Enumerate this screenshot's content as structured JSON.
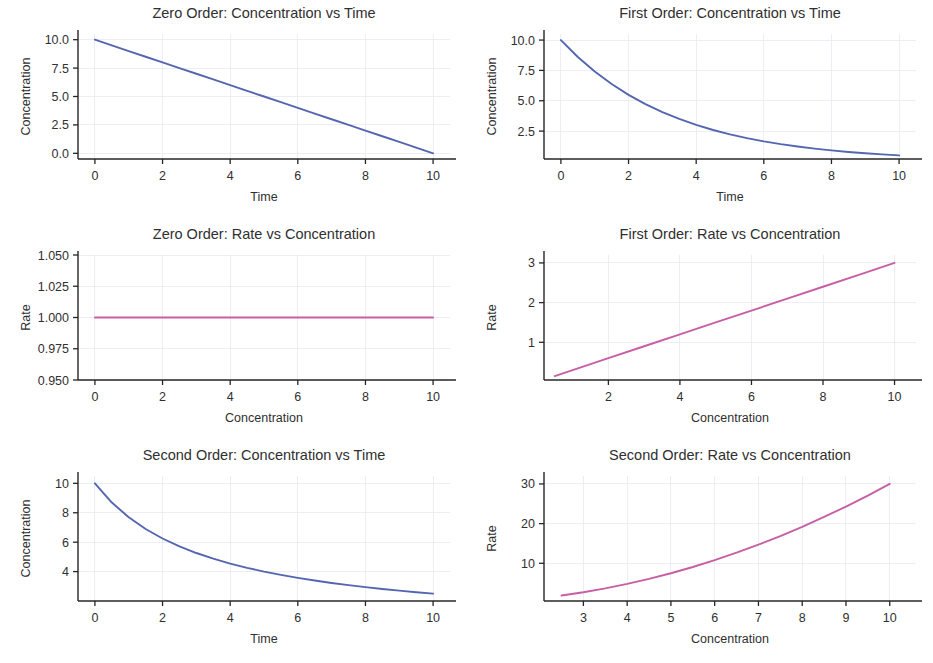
{
  "figure": {
    "background": "#ffffff",
    "rows": 3,
    "cols": 2,
    "width": 933,
    "height": 663
  },
  "colors": {
    "concentration_line": "#5566b0",
    "rate_line": "#c75fa5",
    "axis": "#262626",
    "grid": "#e9e9f2",
    "text": "#2f2f2f"
  },
  "chart_data": [
    {
      "id": "zero-order-conc-vs-time",
      "type": "line",
      "title": "Zero Order: Concentration vs Time",
      "xlabel": "Time",
      "ylabel": "Concentration",
      "color": "#5566b0",
      "xlim": [
        -0.5,
        10.5
      ],
      "ylim": [
        -0.5,
        10.5
      ],
      "xticks": [
        0,
        2,
        4,
        6,
        8,
        10
      ],
      "xticklabels": [
        "0",
        "2",
        "4",
        "6",
        "8",
        "10"
      ],
      "yticks": [
        0.0,
        2.5,
        5.0,
        7.5,
        10.0
      ],
      "yticklabels": [
        "0.0",
        "2.5",
        "5.0",
        "7.5",
        "10.0"
      ],
      "grid": true,
      "equation": "C = 10 - 1.0 t",
      "x": [
        0,
        0.5,
        1,
        1.5,
        2,
        2.5,
        3,
        3.5,
        4,
        4.5,
        5,
        5.5,
        6,
        6.5,
        7,
        7.5,
        8,
        8.5,
        9,
        9.5,
        10
      ],
      "y": [
        10.0,
        9.5,
        9.0,
        8.5,
        8.0,
        7.5,
        7.0,
        6.5,
        6.0,
        5.5,
        5.0,
        4.5,
        4.0,
        3.5,
        3.0,
        2.5,
        2.0,
        1.5,
        1.0,
        0.5,
        0.0
      ]
    },
    {
      "id": "first-order-conc-vs-time",
      "type": "line",
      "title": "First Order: Concentration vs Time",
      "xlabel": "Time",
      "ylabel": "Concentration",
      "color": "#5566b0",
      "xlim": [
        -0.5,
        10.5
      ],
      "ylim": [
        0.2,
        10.5
      ],
      "xticks": [
        0,
        2,
        4,
        6,
        8,
        10
      ],
      "xticklabels": [
        "0",
        "2",
        "4",
        "6",
        "8",
        "10"
      ],
      "yticks": [
        2.5,
        5.0,
        7.5,
        10.0
      ],
      "yticklabels": [
        "2.5",
        "5.0",
        "7.5",
        "10.0"
      ],
      "grid": true,
      "equation": "C = 10 e^(-0.3 t)",
      "x": [
        0,
        0.5,
        1,
        1.5,
        2,
        2.5,
        3,
        3.5,
        4,
        4.5,
        5,
        5.5,
        6,
        6.5,
        7,
        7.5,
        8,
        8.5,
        9,
        9.5,
        10
      ],
      "y": [
        10.0,
        8.607,
        7.408,
        6.376,
        5.488,
        4.724,
        4.066,
        3.499,
        3.012,
        2.592,
        2.231,
        1.921,
        1.653,
        1.423,
        1.225,
        1.054,
        0.907,
        0.781,
        0.672,
        0.578,
        0.498
      ]
    },
    {
      "id": "zero-order-rate-vs-conc",
      "type": "line",
      "title": "Zero Order: Rate vs Concentration",
      "xlabel": "Concentration",
      "ylabel": "Rate",
      "color": "#c75fa5",
      "xlim": [
        -0.5,
        10.5
      ],
      "ylim": [
        0.95,
        1.05
      ],
      "xticks": [
        0,
        2,
        4,
        6,
        8,
        10
      ],
      "xticklabels": [
        "0",
        "2",
        "4",
        "6",
        "8",
        "10"
      ],
      "yticks": [
        0.95,
        0.975,
        1.0,
        1.025,
        1.05
      ],
      "yticklabels": [
        "0.950",
        "0.975",
        "1.000",
        "1.025",
        "1.050"
      ],
      "grid": true,
      "equation": "Rate = 1.0 (constant)",
      "x": [
        0,
        1,
        2,
        3,
        4,
        5,
        6,
        7,
        8,
        9,
        10
      ],
      "y": [
        1.0,
        1.0,
        1.0,
        1.0,
        1.0,
        1.0,
        1.0,
        1.0,
        1.0,
        1.0,
        1.0
      ]
    },
    {
      "id": "first-order-rate-vs-conc",
      "type": "line",
      "title": "First Order: Rate vs Concentration",
      "xlabel": "Concentration",
      "ylabel": "Rate",
      "color": "#c75fa5",
      "xlim": [
        0.2,
        10.6
      ],
      "ylim": [
        0.05,
        3.2
      ],
      "xticks": [
        2,
        4,
        6,
        8,
        10
      ],
      "xticklabels": [
        "2",
        "4",
        "6",
        "8",
        "10"
      ],
      "yticks": [
        1,
        2,
        3
      ],
      "yticklabels": [
        "1",
        "2",
        "3"
      ],
      "grid": true,
      "equation": "Rate = 0.3 C",
      "x": [
        0.5,
        1,
        2,
        3,
        4,
        5,
        6,
        7,
        8,
        9,
        10
      ],
      "y": [
        0.15,
        0.3,
        0.6,
        0.9,
        1.2,
        1.5,
        1.8,
        2.1,
        2.4,
        2.7,
        3.0
      ]
    },
    {
      "id": "second-order-conc-vs-time",
      "type": "line",
      "title": "Second Order: Concentration vs Time",
      "xlabel": "Time",
      "ylabel": "Concentration",
      "color": "#5566b0",
      "xlim": [
        -0.5,
        10.5
      ],
      "ylim": [
        2.0,
        10.5
      ],
      "xticks": [
        0,
        2,
        4,
        6,
        8,
        10
      ],
      "xticklabels": [
        "0",
        "2",
        "4",
        "6",
        "8",
        "10"
      ],
      "yticks": [
        4,
        6,
        8,
        10
      ],
      "yticklabels": [
        "4",
        "6",
        "8",
        "10"
      ],
      "grid": true,
      "equation": "C = 1 / (0.1 + 0.03 t)",
      "x": [
        0,
        0.5,
        1,
        1.5,
        2,
        2.5,
        3,
        3.5,
        4,
        4.5,
        5,
        5.5,
        6,
        6.5,
        7,
        7.5,
        8,
        8.5,
        9,
        9.5,
        10
      ],
      "y": [
        10.0,
        8.696,
        7.692,
        6.897,
        6.25,
        5.714,
        5.263,
        4.878,
        4.545,
        4.255,
        4.0,
        3.774,
        3.571,
        3.39,
        3.226,
        3.077,
        2.941,
        2.817,
        2.703,
        2.597,
        2.5
      ]
    },
    {
      "id": "second-order-rate-vs-conc",
      "type": "line",
      "title": "Second Order: Rate vs Concentration",
      "xlabel": "Concentration",
      "ylabel": "Rate",
      "color": "#c75fa5",
      "xlim": [
        2.1,
        10.6
      ],
      "ylim": [
        0.5,
        32
      ],
      "xticks": [
        3,
        4,
        5,
        6,
        7,
        8,
        9,
        10
      ],
      "xticklabels": [
        "3",
        "4",
        "5",
        "6",
        "7",
        "8",
        "9",
        "10"
      ],
      "yticks": [
        10,
        20,
        30
      ],
      "yticklabels": [
        "10",
        "20",
        "30"
      ],
      "grid": true,
      "equation": "Rate = 0.3 C^2",
      "x": [
        2.5,
        3,
        3.5,
        4,
        4.5,
        5,
        5.5,
        6,
        6.5,
        7,
        7.5,
        8,
        8.5,
        9,
        9.5,
        10
      ],
      "y": [
        1.875,
        2.7,
        3.675,
        4.8,
        6.075,
        7.5,
        9.075,
        10.8,
        12.675,
        14.7,
        16.875,
        19.2,
        21.675,
        24.3,
        27.075,
        30.0
      ]
    }
  ]
}
